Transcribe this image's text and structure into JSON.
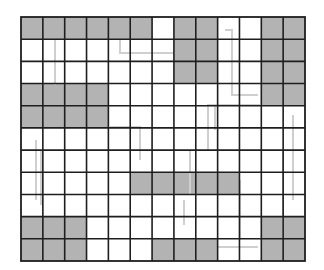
{
  "diagram": {
    "type": "grid",
    "rows": 11,
    "cols": 13,
    "origin": {
      "x": 21,
      "y": 17
    },
    "size": {
      "width": 284,
      "height": 244
    },
    "colors": {
      "shaded": "#b3b3b3",
      "empty": "#ffffff",
      "gridline": "#1e1e1e",
      "pathline": "#cfcfcf"
    },
    "shaded_cells": [
      [
        0,
        0
      ],
      [
        0,
        1
      ],
      [
        0,
        2
      ],
      [
        0,
        3
      ],
      [
        0,
        4
      ],
      [
        0,
        5
      ],
      [
        0,
        7
      ],
      [
        0,
        8
      ],
      [
        0,
        11
      ],
      [
        0,
        12
      ],
      [
        1,
        7
      ],
      [
        1,
        8
      ],
      [
        1,
        11
      ],
      [
        1,
        12
      ],
      [
        2,
        7
      ],
      [
        2,
        8
      ],
      [
        2,
        11
      ],
      [
        2,
        12
      ],
      [
        3,
        0
      ],
      [
        3,
        1
      ],
      [
        3,
        2
      ],
      [
        3,
        3
      ],
      [
        3,
        11
      ],
      [
        3,
        12
      ],
      [
        4,
        0
      ],
      [
        4,
        1
      ],
      [
        4,
        2
      ],
      [
        4,
        3
      ],
      [
        7,
        5
      ],
      [
        7,
        6
      ],
      [
        7,
        7
      ],
      [
        7,
        8
      ],
      [
        7,
        9
      ],
      [
        9,
        0
      ],
      [
        9,
        1
      ],
      [
        9,
        2
      ],
      [
        9,
        11
      ],
      [
        9,
        12
      ],
      [
        10,
        0
      ],
      [
        10,
        1
      ],
      [
        10,
        2
      ],
      [
        10,
        6
      ],
      [
        10,
        7
      ],
      [
        10,
        8
      ],
      [
        10,
        11
      ],
      [
        10,
        12
      ]
    ],
    "path_lines": [
      [
        [
          55,
          40
        ],
        [
          55,
          85
        ]
      ],
      [
        [
          120,
          40
        ],
        [
          120,
          53
        ],
        [
          175,
          53
        ]
      ],
      [
        [
          225,
          30
        ],
        [
          232,
          30
        ],
        [
          232,
          95
        ],
        [
          258,
          95
        ]
      ],
      [
        [
          208,
          150
        ],
        [
          208,
          105
        ],
        [
          260,
          105
        ]
      ],
      [
        [
          215,
          105
        ],
        [
          215,
          130
        ]
      ],
      [
        [
          293,
          115
        ],
        [
          293,
          200
        ]
      ],
      [
        [
          283,
          150
        ],
        [
          283,
          240
        ]
      ],
      [
        [
          110,
          127
        ],
        [
          140,
          127
        ],
        [
          140,
          160
        ]
      ],
      [
        [
          36,
          140
        ],
        [
          36,
          200
        ]
      ],
      [
        [
          41,
          150
        ],
        [
          41,
          205
        ]
      ],
      [
        [
          190,
          150
        ],
        [
          190,
          195
        ]
      ],
      [
        [
          184,
          200
        ],
        [
          184,
          225
        ]
      ],
      [
        [
          240,
          180
        ],
        [
          240,
          240
        ]
      ],
      [
        [
          218,
          247
        ],
        [
          258,
          247
        ]
      ]
    ]
  }
}
